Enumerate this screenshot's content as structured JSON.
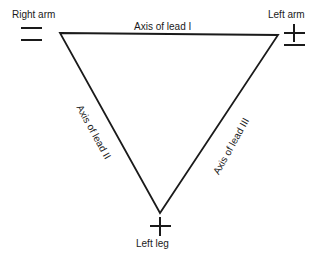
{
  "figure": {
    "background_color": "#ffffff",
    "stroke_color": "#1a1a1a",
    "vertices": {
      "right_arm": {
        "label": "Right arm",
        "polarity": "minus-minus",
        "x": 60,
        "y": 33
      },
      "left_arm": {
        "label": "Left arm",
        "polarity": "plus-minus",
        "x": 278,
        "y": 35
      },
      "left_leg": {
        "label": "Left leg",
        "polarity": "plus",
        "x": 160,
        "y": 213
      }
    },
    "sides": [
      {
        "name": "axis-lead-1",
        "label": "Axis of lead I",
        "from": "right_arm",
        "to": "left_arm",
        "rotation_deg": 0
      },
      {
        "name": "axis-lead-2",
        "label": "Axis of lead II",
        "from": "right_arm",
        "to": "left_leg",
        "rotation_deg": 61
      },
      {
        "name": "axis-lead-3",
        "label": "Axis of lead III",
        "from": "left_leg",
        "to": "left_arm",
        "rotation_deg": -61
      }
    ]
  }
}
